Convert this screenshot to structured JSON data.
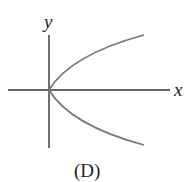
{
  "diagram": {
    "caption": "(D)",
    "axes": {
      "x_label": "x",
      "y_label": "y"
    },
    "curve": {
      "description": "parabola opening right, x = y^2, vertex at origin",
      "color": "#777777"
    },
    "axis_color": "#333333"
  }
}
